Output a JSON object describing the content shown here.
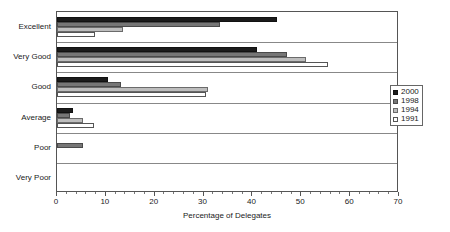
{
  "chart_data": {
    "type": "bar",
    "orientation": "horizontal",
    "title": "",
    "xlabel": "Percentage of Delegates",
    "ylabel": "",
    "xlim": [
      0,
      70
    ],
    "xticks": [
      0,
      10,
      20,
      30,
      40,
      50,
      60,
      70
    ],
    "xtick_labels": [
      "0",
      "10",
      "20",
      "30",
      "40",
      "50",
      "60",
      "70"
    ],
    "minor_tick_interval": 2,
    "grid": false,
    "legend_position": "right",
    "categories": [
      "Excellent",
      "Very Good",
      "Good",
      "Average",
      "Poor",
      "Very Poor"
    ],
    "series": [
      {
        "name": "2000",
        "color": "#1b1b1b",
        "values": [
          45,
          41,
          10.5,
          3.3,
          0,
          0
        ]
      },
      {
        "name": "1998",
        "color": "#767676",
        "values": [
          33.4,
          47,
          13,
          2.7,
          5.3,
          0
        ]
      },
      {
        "name": "1994",
        "color": "#bdbdbd",
        "values": [
          13.5,
          51,
          31,
          5.3,
          0,
          0
        ]
      },
      {
        "name": "1991",
        "color": "#ffffff",
        "values": [
          7.8,
          55.5,
          30.5,
          7.6,
          0,
          0
        ]
      }
    ]
  },
  "legend": {
    "items": [
      {
        "label": "2000"
      },
      {
        "label": "1998"
      },
      {
        "label": "1994"
      },
      {
        "label": "1991"
      }
    ]
  }
}
